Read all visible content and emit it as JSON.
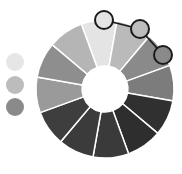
{
  "wheel": {
    "cx": 105,
    "cy": 89,
    "outer_radius": 69,
    "inner_radius": 23,
    "start_angle": -110,
    "gap_color": "#ffffff",
    "segments": [
      {
        "name": "segment-top",
        "color": "#e4e4e4"
      },
      {
        "name": "segment-top-right",
        "color": "#bababa"
      },
      {
        "name": "segment-right-upper",
        "color": "#8a8a8a"
      },
      {
        "name": "segment-right",
        "color": "#7c7c7c"
      },
      {
        "name": "segment-right-lower",
        "color": "#303030"
      },
      {
        "name": "segment-bottom-right",
        "color": "#2e2e2e"
      },
      {
        "name": "segment-bottom",
        "color": "#3a3a3a"
      },
      {
        "name": "segment-bottom-left",
        "color": "#3b3b3b"
      },
      {
        "name": "segment-left-lower",
        "color": "#3e3e3e"
      },
      {
        "name": "segment-left",
        "color": "#9a9a9a"
      },
      {
        "name": "segment-left-upper",
        "color": "#8e8e8e"
      },
      {
        "name": "segment-top-left",
        "color": "#b5b5b5"
      }
    ]
  },
  "handles": [
    {
      "name": "handle-1",
      "cx": 104,
      "cy": 20,
      "r": 9,
      "color": "#e4e4e4"
    },
    {
      "name": "handle-2",
      "cx": 140,
      "cy": 29,
      "r": 9,
      "color": "#bdbdbd"
    },
    {
      "name": "handle-3",
      "cx": 163,
      "cy": 55,
      "r": 9,
      "color": "#8a8a8a"
    }
  ],
  "handle_stroke": "#1a1a1a",
  "swatches": [
    {
      "name": "swatch-1",
      "cx": 15,
      "cy": 62,
      "r": 9,
      "color": "#e6e6e6"
    },
    {
      "name": "swatch-2",
      "cx": 15,
      "cy": 85,
      "r": 9,
      "color": "#bcbcbc"
    },
    {
      "name": "swatch-3",
      "cx": 15,
      "cy": 107,
      "r": 9,
      "color": "#8a8a8a"
    }
  ]
}
